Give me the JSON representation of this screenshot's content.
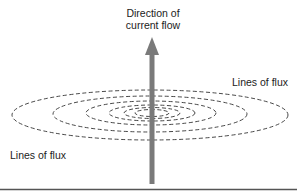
{
  "diagram": {
    "type": "magnetic field around current-carrying conductor",
    "current_label_line1": "Direction of",
    "current_label_line2": "current flow",
    "flux_label_right": "Lines of flux",
    "flux_label_left": "Lines of flux",
    "colors": {
      "conductor": "#7a7a7a",
      "flux_lines": "#333333",
      "bottom_rule": "#555555",
      "text": "#222222"
    },
    "flux_ellipses": [
      {
        "rx": 138,
        "ry": 25
      },
      {
        "rx": 97,
        "ry": 18
      },
      {
        "rx": 65,
        "ry": 12
      },
      {
        "rx": 43,
        "ry": 8
      },
      {
        "rx": 28,
        "ry": 5.5
      },
      {
        "rx": 17,
        "ry": 3.5
      }
    ]
  }
}
